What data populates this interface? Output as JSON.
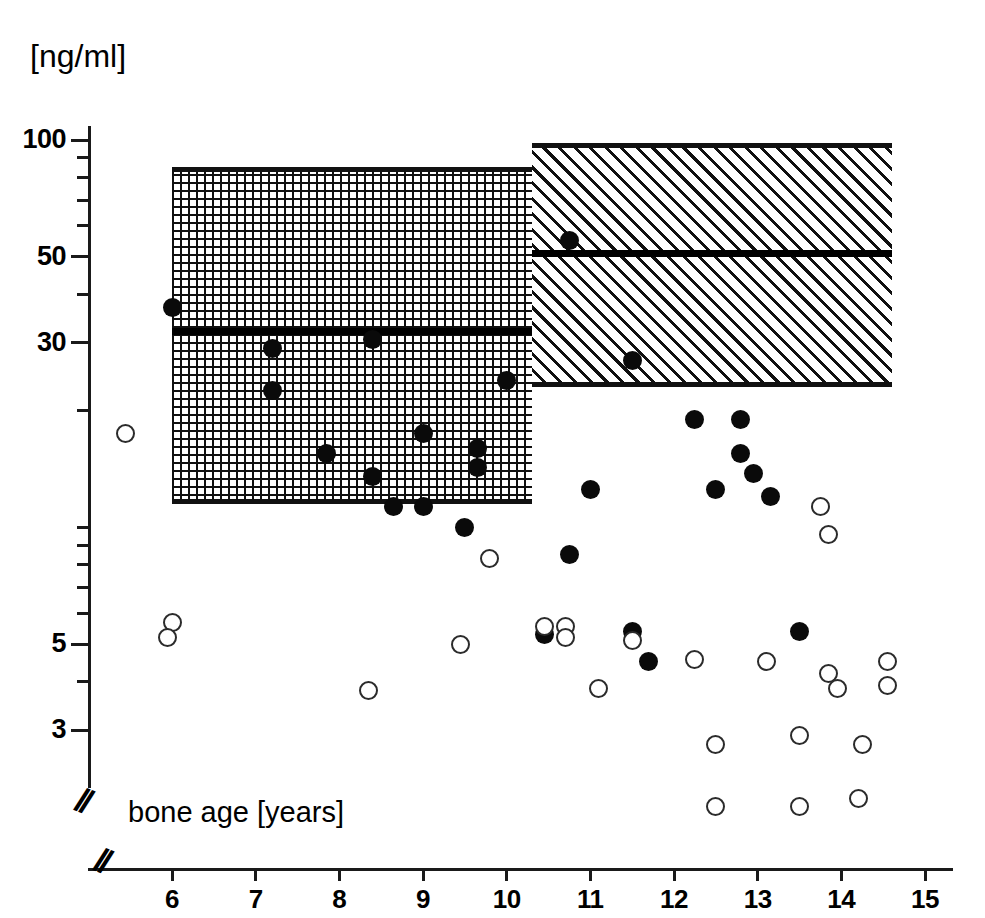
{
  "figure": {
    "unit_label": "[ng/ml]",
    "x_axis_title": "bone age  [years]",
    "axis_break_glyph": "//"
  },
  "chart_data": {
    "type": "scatter",
    "title": "",
    "xlabel": "bone age  [years]",
    "ylabel": "[ng/ml]",
    "yscale": "log",
    "ylim": [
      2.4,
      130
    ],
    "xlim": [
      5.3,
      15.4
    ],
    "grid": false,
    "legend_position": "none",
    "y_tick_labels": [
      "100",
      "50",
      "30",
      "5",
      "3"
    ],
    "y_tick_values": [
      100,
      50,
      30,
      5,
      3
    ],
    "y_minor_tick_values": [
      90,
      80,
      70,
      60,
      40,
      20,
      10,
      9,
      8,
      7,
      6,
      4
    ],
    "x_tick_labels": [
      "6",
      "7",
      "8",
      "9",
      "10",
      "11",
      "12",
      "13",
      "14",
      "15"
    ],
    "x_tick_values": [
      6,
      7,
      8,
      9,
      10,
      11,
      12,
      13,
      14,
      15
    ],
    "annotations": [
      {
        "name": "prepubertal-reference-band",
        "pattern": "cross-hatch",
        "x_range": [
          6.0,
          10.3
        ],
        "y_range": [
          11.5,
          85
        ],
        "median": 32
      },
      {
        "name": "pubertal-reference-band",
        "pattern": "diagonal-hatch",
        "x_range": [
          10.3,
          14.6
        ],
        "y_range": [
          23,
          98
        ],
        "median": 51
      }
    ],
    "series": [
      {
        "name": "filled-circles",
        "marker": "filled-circle",
        "points": [
          [
            6.0,
            37.0
          ],
          [
            7.2,
            29.0
          ],
          [
            7.2,
            22.5
          ],
          [
            7.85,
            15.5
          ],
          [
            8.4,
            30.5
          ],
          [
            8.4,
            13.5
          ],
          [
            8.65,
            11.3
          ],
          [
            9.0,
            11.3
          ],
          [
            9.0,
            17.5
          ],
          [
            9.5,
            10.0
          ],
          [
            9.65,
            16.0
          ],
          [
            9.65,
            14.3
          ],
          [
            10.0,
            24.0
          ],
          [
            10.45,
            5.3
          ],
          [
            10.75,
            55.0
          ],
          [
            10.75,
            8.5
          ],
          [
            11.0,
            12.5
          ],
          [
            11.5,
            27.0
          ],
          [
            11.5,
            5.4
          ],
          [
            11.7,
            4.5
          ],
          [
            12.25,
            19.0
          ],
          [
            12.5,
            12.5
          ],
          [
            12.8,
            19.0
          ],
          [
            12.8,
            15.5
          ],
          [
            12.95,
            13.8
          ],
          [
            13.15,
            12.0
          ],
          [
            13.5,
            5.4
          ]
        ]
      },
      {
        "name": "open-circles",
        "marker": "open-circle",
        "points": [
          [
            5.45,
            17.5
          ],
          [
            6.0,
            5.7
          ],
          [
            5.95,
            5.2
          ],
          [
            8.35,
            3.8
          ],
          [
            9.45,
            5.0
          ],
          [
            9.8,
            8.3
          ],
          [
            10.45,
            5.55
          ],
          [
            10.7,
            5.55
          ],
          [
            10.7,
            5.2
          ],
          [
            11.1,
            3.85
          ],
          [
            11.5,
            5.1
          ],
          [
            12.25,
            4.55
          ],
          [
            12.5,
            2.75
          ],
          [
            12.5,
            1.9
          ],
          [
            13.1,
            4.5
          ],
          [
            13.5,
            2.9
          ],
          [
            13.5,
            1.9
          ],
          [
            13.75,
            11.3
          ],
          [
            13.85,
            9.6
          ],
          [
            13.85,
            4.2
          ],
          [
            13.95,
            3.85
          ],
          [
            14.2,
            2.0
          ],
          [
            14.25,
            2.75
          ],
          [
            14.55,
            4.5
          ],
          [
            14.55,
            3.9
          ]
        ]
      }
    ]
  }
}
